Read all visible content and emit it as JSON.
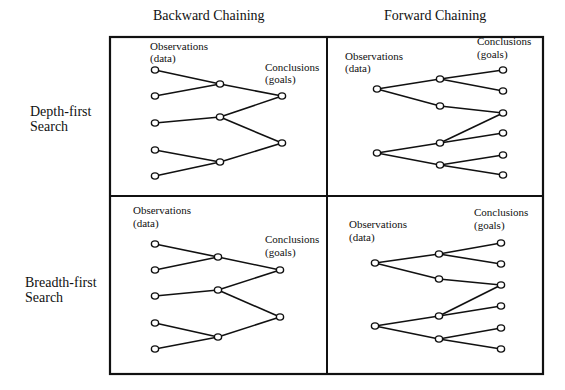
{
  "column_headers": [
    "Backward Chaining",
    "Forward Chaining"
  ],
  "row_labels": [
    {
      "line1": "Depth-first",
      "line2": "Search"
    },
    {
      "line1": "Breadth-first",
      "line2": "Search"
    }
  ],
  "colors": {
    "stroke": "#111111",
    "node_fill": "#ffffff",
    "background": "#ffffff"
  },
  "frame": {
    "x": 110,
    "y": 37,
    "width": 433,
    "height": 337,
    "divider_x": 327,
    "divider_y": 196
  },
  "panels": [
    {
      "name": "backward-depth-first",
      "labels": [
        {
          "text": "Observations",
          "x": 150,
          "y": 50
        },
        {
          "text": "(data)",
          "x": 150,
          "y": 62
        },
        {
          "text": "Conclusions",
          "x": 265,
          "y": 71
        },
        {
          "text": "(goals)",
          "x": 265,
          "y": 83
        }
      ],
      "nodes": [
        [
          155,
          70
        ],
        [
          155,
          96
        ],
        [
          155,
          123
        ],
        [
          155,
          150
        ],
        [
          155,
          176
        ],
        [
          220,
          84
        ],
        [
          220,
          117
        ],
        [
          220,
          162
        ],
        [
          282,
          96
        ],
        [
          282,
          143
        ]
      ],
      "edges": [
        [
          0,
          5
        ],
        [
          1,
          5
        ],
        [
          2,
          6
        ],
        [
          3,
          7
        ],
        [
          4,
          7
        ],
        [
          5,
          8
        ],
        [
          6,
          8
        ],
        [
          6,
          9
        ],
        [
          7,
          9
        ]
      ]
    },
    {
      "name": "forward-depth-first",
      "labels": [
        {
          "text": "Observations",
          "x": 345,
          "y": 60
        },
        {
          "text": "(data)",
          "x": 345,
          "y": 72
        },
        {
          "text": "Conclusions",
          "x": 477,
          "y": 45
        },
        {
          "text": "(goals)",
          "x": 477,
          "y": 58
        }
      ],
      "nodes": [
        [
          377,
          89
        ],
        [
          377,
          153
        ],
        [
          440,
          79
        ],
        [
          440,
          106
        ],
        [
          440,
          143
        ],
        [
          440,
          165
        ],
        [
          503,
          70
        ],
        [
          503,
          91
        ],
        [
          503,
          113
        ],
        [
          503,
          133
        ],
        [
          503,
          155
        ],
        [
          503,
          175
        ]
      ],
      "edges": [
        [
          0,
          2
        ],
        [
          0,
          3
        ],
        [
          1,
          4
        ],
        [
          1,
          5
        ],
        [
          2,
          6
        ],
        [
          2,
          7
        ],
        [
          3,
          8
        ],
        [
          4,
          8
        ],
        [
          4,
          9
        ],
        [
          5,
          10
        ],
        [
          5,
          11
        ]
      ]
    },
    {
      "name": "backward-breadth-first",
      "labels": [
        {
          "text": "Observations",
          "x": 133,
          "y": 214
        },
        {
          "text": "(data)",
          "x": 133,
          "y": 227
        },
        {
          "text": "Conclusions",
          "x": 265,
          "y": 243
        },
        {
          "text": "(goals)",
          "x": 265,
          "y": 256
        }
      ],
      "nodes": [
        [
          155,
          244
        ],
        [
          155,
          270
        ],
        [
          155,
          296
        ],
        [
          155,
          323
        ],
        [
          155,
          349
        ],
        [
          218,
          257
        ],
        [
          218,
          290
        ],
        [
          218,
          337
        ],
        [
          280,
          270
        ],
        [
          280,
          317
        ]
      ],
      "edges": [
        [
          0,
          5
        ],
        [
          1,
          5
        ],
        [
          2,
          6
        ],
        [
          3,
          7
        ],
        [
          4,
          7
        ],
        [
          5,
          8
        ],
        [
          6,
          8
        ],
        [
          6,
          9
        ],
        [
          7,
          9
        ]
      ]
    },
    {
      "name": "forward-breadth-first",
      "labels": [
        {
          "text": "Observations",
          "x": 349,
          "y": 228
        },
        {
          "text": "(data)",
          "x": 349,
          "y": 241
        },
        {
          "text": "Conclusions",
          "x": 474,
          "y": 216
        },
        {
          "text": "(goals)",
          "x": 474,
          "y": 229
        }
      ],
      "nodes": [
        [
          375,
          263
        ],
        [
          375,
          326
        ],
        [
          439,
          254
        ],
        [
          439,
          279
        ],
        [
          439,
          316
        ],
        [
          439,
          339
        ],
        [
          501,
          243
        ],
        [
          501,
          264
        ],
        [
          501,
          285
        ],
        [
          501,
          306
        ],
        [
          501,
          328
        ],
        [
          501,
          349
        ]
      ],
      "edges": [
        [
          0,
          2
        ],
        [
          0,
          3
        ],
        [
          1,
          4
        ],
        [
          1,
          5
        ],
        [
          2,
          6
        ],
        [
          2,
          7
        ],
        [
          3,
          8
        ],
        [
          4,
          8
        ],
        [
          4,
          9
        ],
        [
          5,
          10
        ],
        [
          5,
          11
        ]
      ]
    }
  ]
}
